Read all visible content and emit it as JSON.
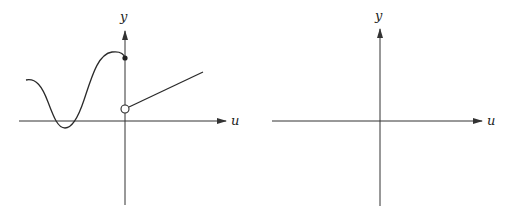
{
  "left_graph": {
    "x_axis_label": "u",
    "y_axis_label": "y",
    "description": "Piecewise function: wavy curve for u<0 ending at a filled point on the y-axis; for u>0 a straight line starting at an open circle on the y-axis",
    "filled_point": "closed dot on y-axis (u=0, upper value)",
    "open_point": "open circle on y-axis (u=0, lower value)"
  },
  "right_graph": {
    "x_axis_label": "u",
    "y_axis_label": "y",
    "description": "Empty coordinate axes"
  }
}
